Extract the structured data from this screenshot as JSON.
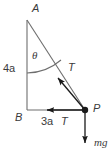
{
  "figure": {
    "type": "free-body-diagram",
    "colors": {
      "line": "#6e6e6e",
      "vector": "#1a1a1a",
      "label": "#3b3b3b",
      "background": "#ffffff"
    },
    "vertices": {
      "apex_label": "A",
      "bottom_left_label": "B",
      "bottom_right_label": "P"
    },
    "dimensions": {
      "vertical_leg": "4a",
      "horizontal_leg": "3a"
    },
    "angle": {
      "symbol": "θ",
      "at_vertex": "A"
    },
    "forces": [
      {
        "label": "T",
        "direction": "up-left along hypotenuse toward A"
      },
      {
        "label": "T",
        "direction": "left along base toward B"
      },
      {
        "label": "mg",
        "direction": "down"
      }
    ]
  }
}
